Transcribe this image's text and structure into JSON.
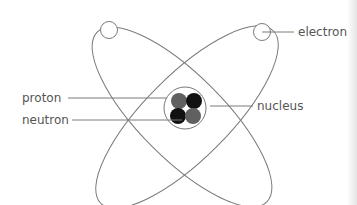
{
  "diagram": {
    "labels": {
      "electron": "electron",
      "proton": "proton",
      "neutron": "neutron",
      "nucleus": "nucleus"
    },
    "colors": {
      "line": "#777777",
      "text": "#555555",
      "proton": "#606060",
      "neutron": "#111111",
      "background": "#ffffff"
    },
    "particles": [
      {
        "type": "proton",
        "position": "top-left"
      },
      {
        "type": "neutron",
        "position": "top-right"
      },
      {
        "type": "neutron",
        "position": "bottom-left"
      },
      {
        "type": "proton",
        "position": "bottom-right"
      }
    ],
    "electrons": 2,
    "orbits": 2
  }
}
